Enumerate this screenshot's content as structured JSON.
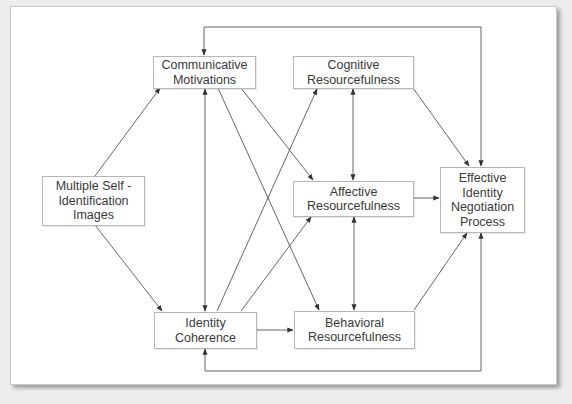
{
  "diagram": {
    "type": "flow-model",
    "nodes": {
      "multiple_self": {
        "label": "Multiple Self -\nIdentification\nImages"
      },
      "communicative": {
        "label": "Communicative\nMotivations"
      },
      "identity_coherence": {
        "label": "Identity\nCoherence"
      },
      "cognitive": {
        "label": "Cognitive\nResourcefulness"
      },
      "affective": {
        "label": "Affective\nResourcefulness"
      },
      "behavioral": {
        "label": "Behavioral\nResourcefulness"
      },
      "effective": {
        "label": "Effective\nIdentity\nNegotiation\nProcess"
      }
    },
    "edges": [
      {
        "from": "Multiple Self - Identification Images",
        "to": "Communicative Motivations",
        "type": "directed"
      },
      {
        "from": "Multiple Self - Identification Images",
        "to": "Identity Coherence",
        "type": "directed"
      },
      {
        "from": "Communicative Motivations",
        "to": "Identity Coherence",
        "type": "bidirectional"
      },
      {
        "from": "Communicative Motivations",
        "to": "Affective Resourcefulness",
        "type": "directed"
      },
      {
        "from": "Communicative Motivations",
        "to": "Behavioral Resourcefulness",
        "type": "directed"
      },
      {
        "from": "Identity Coherence",
        "to": "Cognitive Resourcefulness",
        "type": "directed"
      },
      {
        "from": "Identity Coherence",
        "to": "Affective Resourcefulness",
        "type": "directed"
      },
      {
        "from": "Identity Coherence",
        "to": "Behavioral Resourcefulness",
        "type": "directed"
      },
      {
        "from": "Cognitive Resourcefulness",
        "to": "Affective Resourcefulness",
        "type": "bidirectional"
      },
      {
        "from": "Affective Resourcefulness",
        "to": "Behavioral Resourcefulness",
        "type": "bidirectional"
      },
      {
        "from": "Cognitive Resourcefulness",
        "to": "Effective Identity Negotiation Process",
        "type": "directed"
      },
      {
        "from": "Affective Resourcefulness",
        "to": "Effective Identity Negotiation Process",
        "type": "directed"
      },
      {
        "from": "Behavioral Resourcefulness",
        "to": "Effective Identity Negotiation Process",
        "type": "directed"
      },
      {
        "from": "Effective Identity Negotiation Process",
        "to": "Communicative Motivations",
        "type": "feedback-loop-top",
        "bidirectional": true
      },
      {
        "from": "Effective Identity Negotiation Process",
        "to": "Identity Coherence",
        "type": "feedback-loop-bottom",
        "bidirectional": true
      }
    ]
  }
}
